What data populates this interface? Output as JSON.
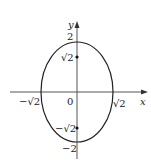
{
  "diagram": {
    "type": "ellipse-graph",
    "axes": {
      "x_label": "x",
      "y_label": "y",
      "origin_label": "0"
    },
    "x_ticks": {
      "neg_root2": "−√2",
      "pos_root2": "√2"
    },
    "y_ticks": {
      "pos2": "2",
      "pos_root2": "√2",
      "neg_root2": "−√2",
      "neg2": "−2"
    },
    "ellipse": {
      "center": [
        0,
        0
      ],
      "semi_axis_x": "√2",
      "semi_axis_y": "2",
      "foci": [
        [
          0,
          1.414
        ],
        [
          0,
          -1.414
        ]
      ]
    },
    "colors": {
      "stroke": "#222222",
      "background": "#ffffff"
    }
  }
}
